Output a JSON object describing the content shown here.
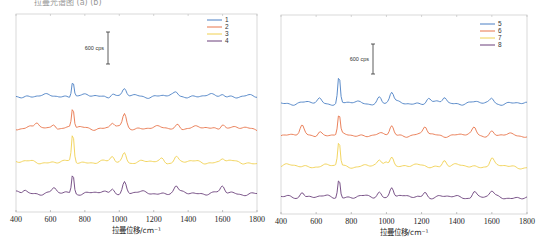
{
  "caption_fragment": "拉曼光谱图 (a) (b)",
  "chart_data": [
    {
      "type": "line",
      "panel": "left",
      "title": "",
      "xlabel": "拉曼位移/cm⁻¹",
      "ylabel": "",
      "xlim": [
        400,
        1800
      ],
      "xticks": [
        400,
        600,
        800,
        1000,
        1200,
        1400,
        1600,
        1800
      ],
      "grid": false,
      "legend_position": "upper right",
      "scale_bar": {
        "label": "600 cps",
        "value": 600
      },
      "series": [
        {
          "name": "1",
          "color": "#4a7fc4",
          "offset_px": 96,
          "peaks": [
            [
              730,
              16
            ],
            [
              1030,
              6
            ],
            [
              960,
              3
            ],
            [
              1330,
              3
            ],
            [
              1600,
              2
            ]
          ]
        },
        {
          "name": "2",
          "color": "#e8744a",
          "offset_px": 128,
          "peaks": [
            [
              730,
              20
            ],
            [
              1030,
              14
            ],
            [
              520,
              5
            ],
            [
              620,
              5
            ],
            [
              960,
              5
            ],
            [
              1340,
              4
            ],
            [
              1600,
              5
            ]
          ]
        },
        {
          "name": "3",
          "color": "#f0d050",
          "offset_px": 162,
          "peaks": [
            [
              730,
              28
            ],
            [
              1030,
              10
            ],
            [
              960,
              5
            ],
            [
              1250,
              4
            ],
            [
              1330,
              6
            ],
            [
              1600,
              4
            ]
          ]
        },
        {
          "name": "4",
          "color": "#6a3f7a",
          "offset_px": 193,
          "peaks": [
            [
              730,
              20
            ],
            [
              1030,
              11
            ],
            [
              960,
              5
            ],
            [
              620,
              4
            ],
            [
              1330,
              6
            ],
            [
              1600,
              6
            ],
            [
              450,
              3
            ]
          ]
        }
      ]
    },
    {
      "type": "line",
      "panel": "right",
      "title": "",
      "xlabel": "拉曼位移/cm⁻¹",
      "ylabel": "",
      "xlim": [
        400,
        1800
      ],
      "xticks": [
        400,
        600,
        800,
        1000,
        1200,
        1400,
        1600,
        1800
      ],
      "grid": false,
      "legend_position": "upper right",
      "scale_bar": {
        "label": "600 cps",
        "value": 600
      },
      "series": [
        {
          "name": "5",
          "color": "#4a7fc4",
          "offset_px": 103,
          "peaks": [
            [
              730,
              27
            ],
            [
              1030,
              10
            ],
            [
              960,
              6
            ],
            [
              620,
              4
            ],
            [
              1330,
              6
            ],
            [
              1600,
              5
            ],
            [
              1240,
              4
            ]
          ]
        },
        {
          "name": "6",
          "color": "#e8744a",
          "offset_px": 135,
          "peaks": [
            [
              730,
              20
            ],
            [
              1030,
              9
            ],
            [
              520,
              8
            ],
            [
              1220,
              8
            ],
            [
              1500,
              7
            ],
            [
              1600,
              4
            ],
            [
              620,
              4
            ]
          ]
        },
        {
          "name": "7",
          "color": "#f0d050",
          "offset_px": 166,
          "peaks": [
            [
              730,
              25
            ],
            [
              1030,
              11
            ],
            [
              960,
              5
            ],
            [
              1000,
              4
            ],
            [
              1330,
              6
            ],
            [
              1600,
              7
            ]
          ]
        },
        {
          "name": "8",
          "color": "#6a3f7a",
          "offset_px": 197,
          "peaks": [
            [
              730,
              19
            ],
            [
              1030,
              11
            ],
            [
              520,
              6
            ],
            [
              960,
              5
            ],
            [
              1220,
              6
            ],
            [
              1500,
              6
            ],
            [
              1600,
              5
            ]
          ]
        }
      ]
    }
  ]
}
